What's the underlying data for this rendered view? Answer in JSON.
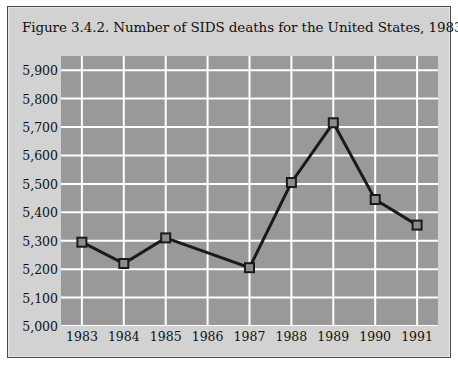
{
  "figure": {
    "title": "Figure 3.4.2. Number of SIDS deaths for the United States, 1983-1991."
  },
  "colors": {
    "page_background": "#ffffff",
    "frame_background": "#d2d2d2",
    "frame_border": "#4a4a4a",
    "plot_background": "#999999",
    "gridline": "#ffffff",
    "series_line": "#1a1a1a",
    "marker_fill": "#8c8c8c",
    "marker_border": "#1a1a1a",
    "text": "#111111"
  },
  "chart_data": {
    "type": "line",
    "title": "Figure 3.4.2. Number of SIDS deaths for the United States, 1983-1991.",
    "xlabel": "",
    "ylabel": "",
    "categories": [
      "1983",
      "1984",
      "1985",
      "1986",
      "1987",
      "1988",
      "1989",
      "1990",
      "1991"
    ],
    "values": [
      5295,
      5220,
      5310,
      null,
      5205,
      5505,
      5715,
      5445,
      5355
    ],
    "ylim": [
      5000,
      5950
    ],
    "xtick_labels": [
      "1983",
      "1984",
      "1985",
      "1986",
      "1987",
      "1988",
      "1989",
      "1990",
      "1991"
    ],
    "ytick_labels": [
      "5,900",
      "5,800",
      "5,700",
      "5,600",
      "5,500",
      "5,400",
      "5,300",
      "5,200",
      "5,100",
      "5,000"
    ],
    "ytick_values": [
      5900,
      5800,
      5700,
      5600,
      5500,
      5400,
      5300,
      5200,
      5100,
      5000
    ],
    "grid": true,
    "grid_orientation": "both",
    "legend": false,
    "legend_position": "none",
    "marker": "square",
    "note": "No data marker is plotted at 1986; the line segment runs directly from 1985 to 1987."
  }
}
